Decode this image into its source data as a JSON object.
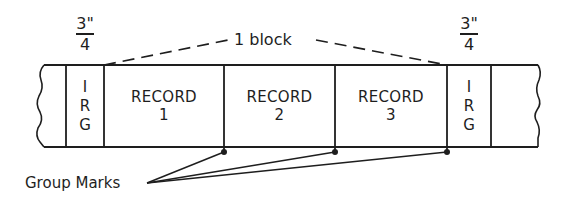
{
  "diagram": {
    "block_label": "1 block",
    "gap_size": {
      "numerator": "3\"",
      "denominator": "4"
    },
    "irg": {
      "letters": [
        "I",
        "R",
        "G"
      ]
    },
    "records": [
      {
        "word": "RECORD",
        "number": "1"
      },
      {
        "word": "RECORD",
        "number": "2"
      },
      {
        "word": "RECORD",
        "number": "3"
      }
    ],
    "group_marks_label": "Group Marks",
    "colors": {
      "ink": "#1e1e1e",
      "background": "#ffffff"
    }
  }
}
